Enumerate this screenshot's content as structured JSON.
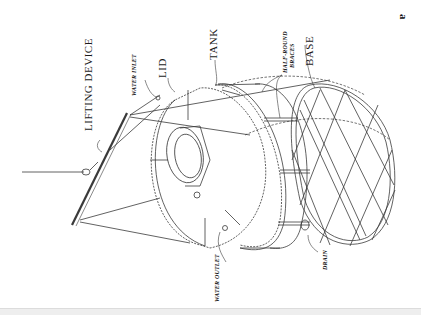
{
  "figure": {
    "label": "a"
  },
  "labels": {
    "lifting_device": "LIFTING DEVICE",
    "water_inlet": "WATER INLET",
    "lid": "LID",
    "tank": "TANK",
    "half_round_braces_line1": "HALF-ROUND",
    "half_round_braces_line2": "BRACES",
    "base": "BASE",
    "water_outlet": "WATER OUTLET",
    "drain": "DRAIN"
  },
  "colors": {
    "line": "#333333",
    "background": "#ffffff",
    "bottom_bar": "#eeeeee"
  }
}
